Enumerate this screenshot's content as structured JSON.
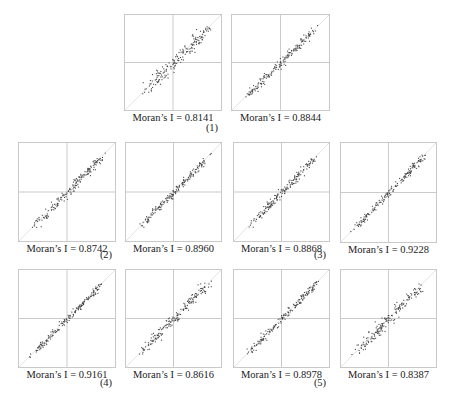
{
  "figure": {
    "caption_faded": true,
    "groups": [
      {
        "label": "(1)",
        "x": 212,
        "y": 122
      },
      {
        "label": "(2)",
        "x": 106,
        "y": 249
      },
      {
        "label": "(3)",
        "x": 320,
        "y": 249
      },
      {
        "label": "(4)",
        "x": 106,
        "y": 377
      },
      {
        "label": "(5)",
        "x": 320,
        "y": 377
      }
    ]
  },
  "chart_data": [
    {
      "type": "scatter",
      "title": "Moran's I scatter plot",
      "group": "(1)",
      "label": "Moran’s I = 0.8141",
      "morans_i": 0.8141,
      "box": [
        124,
        14,
        98,
        97
      ],
      "spread": 0.13,
      "seed": 11,
      "quadrant_lines": true,
      "reference_line": "y=x"
    },
    {
      "type": "scatter",
      "title": "Moran's I scatter plot",
      "group": "(1)",
      "label": "Moran’s I = 0.8844",
      "morans_i": 0.8844,
      "box": [
        231,
        14,
        99,
        97
      ],
      "spread": 0.07,
      "seed": 23,
      "quadrant_lines": true,
      "reference_line": "y=x"
    },
    {
      "type": "scatter",
      "title": "Moran's I scatter plot",
      "group": "(2)",
      "label": "Moran’s I = 0.8742",
      "morans_i": 0.8742,
      "box": [
        18,
        142,
        98,
        100
      ],
      "spread": 0.08,
      "seed": 37,
      "quadrant_lines": true,
      "reference_line": "y=x"
    },
    {
      "type": "scatter",
      "title": "Moran's I scatter plot",
      "group": "(2)",
      "label": "Moran’s I = 0.8960",
      "morans_i": 0.896,
      "box": [
        125,
        142,
        97,
        100
      ],
      "spread": 0.07,
      "seed": 41,
      "quadrant_lines": true,
      "reference_line": "y=x"
    },
    {
      "type": "scatter",
      "title": "Moran's I scatter plot",
      "group": "(3)",
      "label": "Moran’s I = 0.8868",
      "morans_i": 0.8868,
      "box": [
        233,
        142,
        97,
        100
      ],
      "spread": 0.08,
      "seed": 53,
      "quadrant_lines": true,
      "reference_line": "y=x"
    },
    {
      "type": "scatter",
      "title": "Moran's I scatter plot",
      "group": "(3)",
      "label": "Moran’s I = 0.9228",
      "morans_i": 0.9228,
      "box": [
        340,
        142,
        97,
        101
      ],
      "spread": 0.06,
      "seed": 67,
      "quadrant_lines": true,
      "reference_line": "y=x"
    },
    {
      "type": "scatter",
      "title": "Moran's I scatter plot",
      "group": "(4)",
      "label": "Moran’s I = 0.9161",
      "morans_i": 0.9161,
      "box": [
        18,
        269,
        98,
        99
      ],
      "spread": 0.06,
      "seed": 71,
      "quadrant_lines": true,
      "reference_line": "y=x"
    },
    {
      "type": "scatter",
      "title": "Moran's I scatter plot",
      "group": "(4)",
      "label": "Moran’s I = 0.8616",
      "morans_i": 0.8616,
      "box": [
        125,
        269,
        97,
        99
      ],
      "spread": 0.09,
      "seed": 83,
      "quadrant_lines": true,
      "reference_line": "y=x"
    },
    {
      "type": "scatter",
      "title": "Moran's I scatter plot",
      "group": "(5)",
      "label": "Moran’s I = 0.8978",
      "morans_i": 0.8978,
      "box": [
        233,
        269,
        97,
        99
      ],
      "spread": 0.07,
      "seed": 97,
      "quadrant_lines": true,
      "reference_line": "y=x"
    },
    {
      "type": "scatter",
      "title": "Moran's I scatter plot",
      "group": "(5)",
      "label": "Moran’s I = 0.8387",
      "morans_i": 0.8387,
      "box": [
        340,
        269,
        97,
        99
      ],
      "spread": 0.1,
      "seed": 101,
      "quadrant_lines": true,
      "reference_line": "y=x"
    }
  ],
  "colors": {
    "frame": "#c9c9c9",
    "quadrant": "#bdbdbd",
    "diagonal": "#e2e2e2",
    "points": "#444444"
  }
}
